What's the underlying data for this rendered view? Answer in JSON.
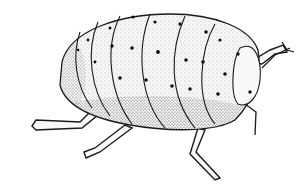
{
  "image": {
    "subject": "stippled ink illustration of a segmented soft-bodied insect (mealybug/grub-like) walking to the right",
    "background": "#ffffff",
    "ink": "#1a1a1a",
    "body_fill": "#f4f4f4",
    "segments": 7,
    "legs_visible": 4,
    "antennae_visible": 2
  }
}
